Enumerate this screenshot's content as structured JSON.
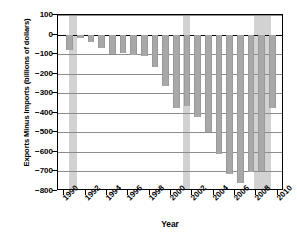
{
  "chart_data": {
    "type": "bar",
    "title": "",
    "xlabel": "Year",
    "ylabel": "Exports Minus Imports (billions of  dollars)",
    "x": [
      1990,
      1991,
      1992,
      1993,
      1994,
      1995,
      1996,
      1997,
      1998,
      1999,
      2000,
      2001,
      2002,
      2003,
      2004,
      2005,
      2006,
      2007,
      2008,
      2009
    ],
    "categories": [
      "1990",
      "1991",
      "1992",
      "1993",
      "1994",
      "1995",
      "1996",
      "1997",
      "1998",
      "1999",
      "2000",
      "2001",
      "2002",
      "2003",
      "2004",
      "2005",
      "2006",
      "2007",
      "2008",
      "2009"
    ],
    "values": [
      -80,
      -20,
      -40,
      -70,
      -98,
      -96,
      -104,
      -108,
      -165,
      -263,
      -378,
      -365,
      -424,
      -499,
      -610,
      -714,
      -760,
      -702,
      -698,
      -375
    ],
    "ylim": [
      -800,
      100
    ],
    "xlim": [
      1989.4,
      2010.6
    ],
    "yticks": [
      100,
      0,
      -100,
      -200,
      -300,
      -400,
      -500,
      -600,
      -700,
      -800
    ],
    "ytick_labels": [
      "100",
      "0",
      "−100",
      "−200",
      "−300",
      "−400",
      "−500",
      "−600",
      "−700",
      "−800"
    ],
    "xticks": [
      1990,
      1992,
      1994,
      1996,
      1998,
      2000,
      2002,
      2004,
      2006,
      2008,
      2010
    ],
    "xtick_labels": [
      "1990",
      "1992",
      "1994",
      "1996",
      "1998",
      "2000",
      "2002",
      "2004",
      "2006",
      "2008",
      "2010"
    ],
    "grid": true,
    "legend": "none",
    "bar_color": "#a8a8a8",
    "shaded_regions": [
      {
        "label": "recession",
        "start": 1990.4,
        "end": 1991.2,
        "color": "#d2d2d2"
      },
      {
        "label": "recession",
        "start": 2001.1,
        "end": 2001.75,
        "color": "#d2d2d2"
      },
      {
        "label": "recession",
        "start": 2007.8,
        "end": 2009.35,
        "color": "#d2d2d2"
      }
    ]
  }
}
